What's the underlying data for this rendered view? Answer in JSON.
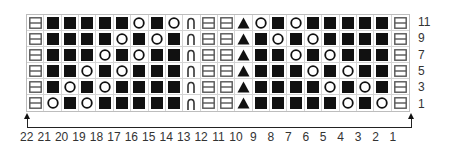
{
  "chart_data": {
    "type": "table",
    "columns": [
      22,
      21,
      20,
      19,
      18,
      17,
      16,
      15,
      14,
      13,
      12,
      11,
      10,
      9,
      8,
      7,
      6,
      5,
      4,
      3,
      2,
      1
    ],
    "rows": [
      {
        "label": "11",
        "cells": [
          "b",
          "k",
          "k",
          "k",
          "k",
          "k",
          "o",
          "k",
          "o",
          "c",
          "b",
          "b",
          "t",
          "o",
          "k",
          "o",
          "k",
          "k",
          "k",
          "k",
          "k",
          "b"
        ]
      },
      {
        "label": "9",
        "cells": [
          "b",
          "k",
          "k",
          "k",
          "k",
          "o",
          "k",
          "o",
          "k",
          "c",
          "b",
          "b",
          "t",
          "k",
          "o",
          "k",
          "o",
          "k",
          "k",
          "k",
          "k",
          "b"
        ]
      },
      {
        "label": "7",
        "cells": [
          "b",
          "k",
          "k",
          "k",
          "o",
          "k",
          "o",
          "k",
          "k",
          "c",
          "b",
          "b",
          "t",
          "k",
          "k",
          "o",
          "k",
          "o",
          "k",
          "k",
          "k",
          "b"
        ]
      },
      {
        "label": "5",
        "cells": [
          "b",
          "k",
          "k",
          "o",
          "k",
          "o",
          "k",
          "k",
          "k",
          "c",
          "b",
          "b",
          "t",
          "k",
          "k",
          "k",
          "o",
          "k",
          "o",
          "k",
          "k",
          "b"
        ]
      },
      {
        "label": "3",
        "cells": [
          "b",
          "k",
          "o",
          "k",
          "o",
          "k",
          "k",
          "k",
          "k",
          "c",
          "b",
          "b",
          "t",
          "k",
          "k",
          "k",
          "k",
          "o",
          "k",
          "o",
          "k",
          "b"
        ]
      },
      {
        "label": "1",
        "cells": [
          "b",
          "o",
          "k",
          "o",
          "k",
          "k",
          "k",
          "k",
          "k",
          "c",
          "b",
          "b",
          "t",
          "k",
          "k",
          "k",
          "k",
          "k",
          "o",
          "k",
          "o",
          "b"
        ]
      }
    ],
    "symbols": {
      "b": "bar-box-icon",
      "k": "filled-square-icon",
      "o": "open-circle-icon",
      "c": "arch-icon",
      "t": "filled-triangle-icon"
    }
  },
  "row_labels": [
    "11",
    "9",
    "7",
    "5",
    "3",
    "1"
  ],
  "col_labels": [
    "22",
    "21",
    "20",
    "19",
    "18",
    "17",
    "16",
    "15",
    "14",
    "13",
    "12",
    "11",
    "10",
    "9",
    "8",
    "7",
    "6",
    "5",
    "4",
    "3",
    "2",
    "1"
  ],
  "colors": {
    "ink": "#111111",
    "grid": "#d4d4d4",
    "bar_box": "#555555"
  }
}
